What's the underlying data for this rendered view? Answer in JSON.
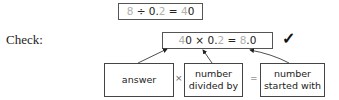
{
  "division_equation": {
    "dividend": "8",
    "op": " ÷ ",
    "divisor_int": "0.",
    "divisor_digit": "2",
    "eq": " = ",
    "quotient_lead": "4",
    "quotient_rest": "0"
  },
  "check": {
    "label": "Check:",
    "equation": {
      "a_lead": "4",
      "a_rest": "0",
      "times": " × ",
      "b_int": "0.",
      "b_digit": "2",
      "eq": " = ",
      "c_lead": "8",
      "c_rest": ".0"
    },
    "checkmark": "✓"
  },
  "explanation": {
    "boxes": [
      "answer",
      "number divided by",
      "number started with"
    ],
    "operators": [
      "×",
      "="
    ]
  }
}
